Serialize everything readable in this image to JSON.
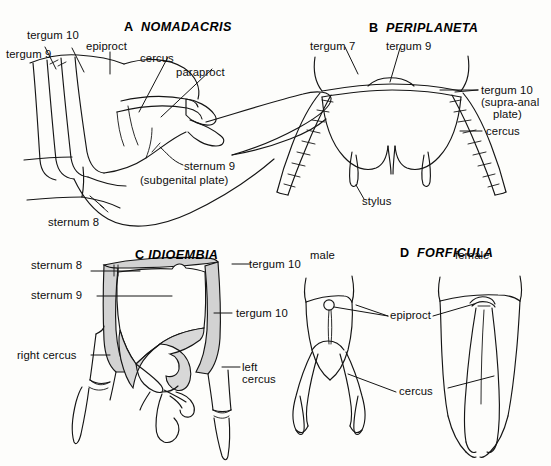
{
  "figure": {
    "background_color": "#fdfdfb",
    "ink_color": "#151515",
    "shade_color": "#d2d2d2",
    "width": 551,
    "height": 466,
    "type": "scientific-line-drawing-plate"
  },
  "panels": [
    {
      "id": "A",
      "letter": "A",
      "genus": "NOMADACRIS",
      "labels": [
        {
          "key": "tergum10",
          "text": "tergum 10"
        },
        {
          "key": "tergum9",
          "text": "tergum 9"
        },
        {
          "key": "epiproct",
          "text": "epiproct"
        },
        {
          "key": "cercus",
          "text": "cercus"
        },
        {
          "key": "paraproct",
          "text": "paraproct"
        },
        {
          "key": "sternum9",
          "text": "sternum 9"
        },
        {
          "key": "sternum9b",
          "text": "(subgenital plate)"
        },
        {
          "key": "sternum8",
          "text": "sternum 8"
        }
      ]
    },
    {
      "id": "B",
      "letter": "B",
      "genus": "PERIPLANETA",
      "labels": [
        {
          "key": "tergum7",
          "text": "tergum 7"
        },
        {
          "key": "tergum9",
          "text": "tergum 9"
        },
        {
          "key": "tergum10",
          "text": "tergum 10"
        },
        {
          "key": "supraanal",
          "text": "(supra-anal"
        },
        {
          "key": "plate",
          "text": "plate)"
        },
        {
          "key": "cercus",
          "text": "cercus"
        },
        {
          "key": "stylus",
          "text": "stylus"
        }
      ]
    },
    {
      "id": "C",
      "letter": "C",
      "genus": "IDIOEMBIA",
      "labels": [
        {
          "key": "sternum8",
          "text": "sternum 8"
        },
        {
          "key": "sternum9",
          "text": "sternum 9"
        },
        {
          "key": "tergum10a",
          "text": "tergum 10"
        },
        {
          "key": "tergum10b",
          "text": "tergum 10"
        },
        {
          "key": "rightcercus",
          "text": "right cercus"
        },
        {
          "key": "leftcercus1",
          "text": "left"
        },
        {
          "key": "leftcercus2",
          "text": "cercus"
        }
      ]
    },
    {
      "id": "D",
      "letter": "D",
      "genus": "FORFICULA",
      "labels": [
        {
          "key": "male",
          "text": "male"
        },
        {
          "key": "female",
          "text": "female"
        },
        {
          "key": "epiproct",
          "text": "epiproct"
        },
        {
          "key": "cercus",
          "text": "cercus"
        }
      ]
    }
  ]
}
